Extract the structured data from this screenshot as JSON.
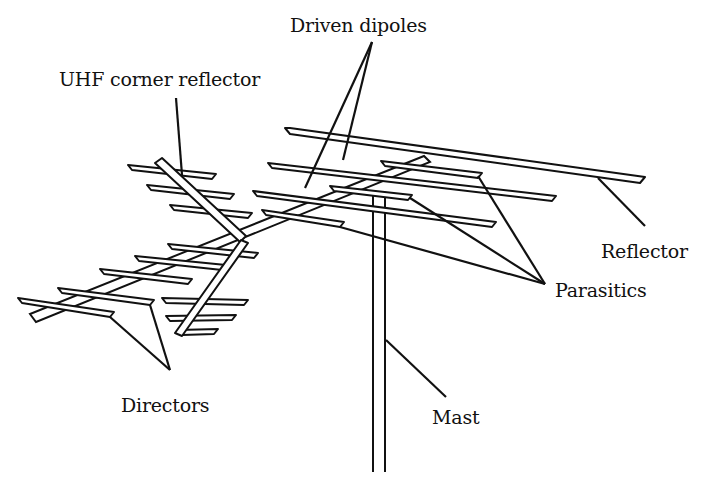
{
  "figure": {
    "colors": {
      "ink": "#111111",
      "background": "#ffffff"
    },
    "labels": {
      "driven_dipoles": "Driven dipoles",
      "uhf_corner_reflector": "UHF corner reflector",
      "reflector": "Reflector",
      "parasitics": "Parasitics",
      "directors": "Directors",
      "mast": "Mast"
    }
  }
}
